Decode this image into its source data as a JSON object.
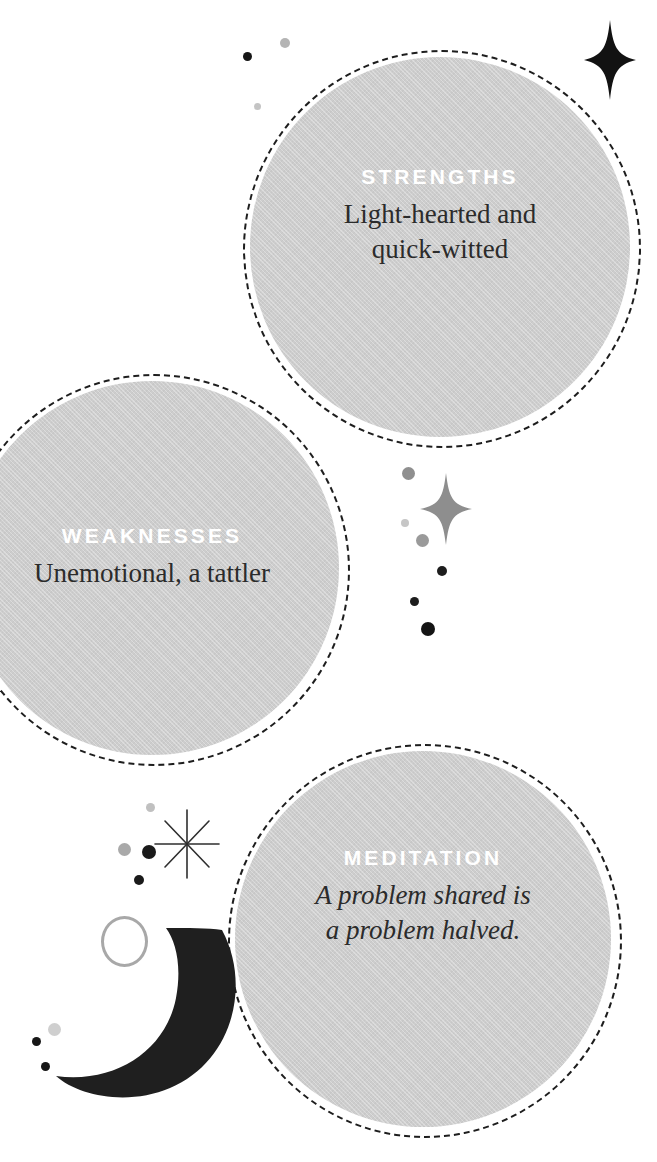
{
  "page": {
    "background_color": "#ffffff",
    "width": 657,
    "height": 1162
  },
  "theme": {
    "bubble_fill": "#cdcdcd",
    "bubble_border": "#1d1d1d",
    "kicker_color": "#ffffff",
    "body_color": "#2b2b2b",
    "moon_color": "#1f1f1f",
    "star_dark_color": "#121212",
    "star_gray_color": "#8e8e8e",
    "ring_color": "#a8a8a8",
    "dot_dark_color": "#161616",
    "dot_gray_color": "#9b9b9b",
    "dot_light_color": "#c9c9c9"
  },
  "bubbles": [
    {
      "id": "strengths",
      "kicker": "STRENGTHS",
      "lines": [
        "Light-hearted and",
        "quick-witted"
      ],
      "italic": false
    },
    {
      "id": "weaknesses",
      "kicker": "WEAKNESSES",
      "lines": [
        "Unemotional, a tattler"
      ],
      "italic": false
    },
    {
      "id": "meditation",
      "kicker": "MEDITATION",
      "lines": [
        "A problem shared is",
        "a problem halved."
      ],
      "italic": true
    }
  ],
  "decorations": {
    "top_star": "four-point-sparkle-star",
    "middle_star": "four-point-sparkle-star",
    "burst_star": "eight-point-burst-star",
    "moon": "crescent-moon",
    "ring": "outline-circle-ring",
    "dot_count": 13
  }
}
